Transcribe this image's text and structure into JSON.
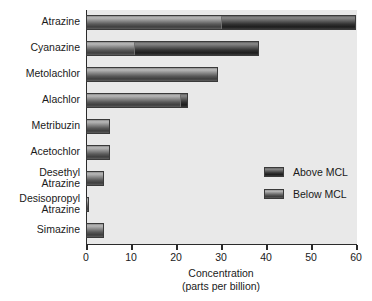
{
  "chart_data": {
    "type": "bar",
    "orientation": "horizontal",
    "title": "",
    "xlabel": "Concentration\n(parts per billion)",
    "xlabel_lines": [
      "Concentration",
      "(parts per billion)"
    ],
    "ylabel": "",
    "xlim": [
      0,
      60
    ],
    "xticks": [
      0,
      10,
      20,
      30,
      40,
      50,
      60
    ],
    "xtick_labels": [
      "0",
      "10",
      "20",
      "30",
      "40",
      "50",
      "60"
    ],
    "grid": false,
    "legend_position": "center-right",
    "categories": [
      "Atrazine",
      "Cyanazine",
      "Metolachlor",
      "Alachlor",
      "Metribuzin",
      "Desethyl\nAtrazine",
      "Desisopropyl\nAtrazine",
      "Simazine"
    ],
    "series": [
      {
        "name": "Below MCL",
        "color": "#8a8a8a",
        "values": [
          30.0,
          10.5,
          29.3,
          21.0,
          5.3,
          3.9,
          0.7,
          4.0
        ]
      },
      {
        "name": "Above MCL",
        "color": "#333333",
        "values": [
          30.0,
          28.0,
          0.0,
          1.7,
          0.0,
          0.0,
          0.0,
          0.0
        ]
      }
    ],
    "totals": [
      60.0,
      38.5,
      29.3,
      22.7,
      5.3,
      5.3,
      3.9,
      0.7,
      4.0
    ],
    "bars": [
      {
        "category": "Atrazine",
        "below": 30.0,
        "above": 30.0,
        "total": 60.0
      },
      {
        "category": "Cyanazine",
        "below": 10.5,
        "above": 28.0,
        "total": 38.5
      },
      {
        "category": "Metolachlor",
        "below": 29.3,
        "above": 0.0,
        "total": 29.3
      },
      {
        "category": "Alachlor",
        "below": 21.0,
        "above": 1.7,
        "total": 22.7
      },
      {
        "category": "Metribuzin",
        "below": 5.3,
        "above": 0.0,
        "total": 5.3
      },
      {
        "category": "Acetochlor",
        "below": 5.3,
        "above": 0.0,
        "total": 5.3
      },
      {
        "category": "Desethyl Atrazine",
        "below": 3.9,
        "above": 0.0,
        "total": 3.9
      },
      {
        "category": "Desisopropyl Atrazine",
        "below": 0.7,
        "above": 0.0,
        "total": 0.7
      },
      {
        "category": "Simazine",
        "below": 4.0,
        "above": 0.0,
        "total": 4.0
      }
    ],
    "category_labels": [
      "Atrazine",
      "Cyanazine",
      "Metolachlor",
      "Alachlor",
      "Metribuzin",
      "Acetochlor",
      "Desethyl\nAtrazine",
      "Desisopropyl\nAtrazine",
      "Simazine"
    ]
  },
  "legend": {
    "items": [
      {
        "label": "Above MCL",
        "color": "#333333"
      },
      {
        "label": "Below MCL",
        "color": "#8a8a8a"
      }
    ]
  },
  "axis": {
    "x_title_line1": "Concentration",
    "x_title_line2": "(parts per billion)",
    "x_tick_labels": [
      "0",
      "10",
      "20",
      "30",
      "40",
      "50",
      "60"
    ]
  },
  "colors": {
    "plot_background": "#e9e9e9",
    "axis_line": "#2b2b2b",
    "above_mcl": "#333333",
    "below_mcl": "#8a8a8a",
    "text": "#1a1a1a"
  }
}
